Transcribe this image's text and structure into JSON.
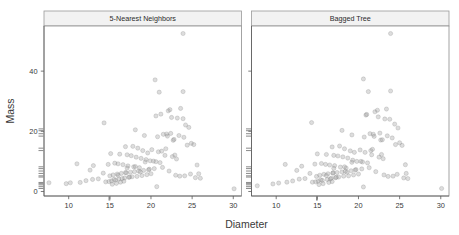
{
  "chart_data": {
    "type": "scatter",
    "title": "",
    "xlabel": "Diameter",
    "ylabel": "Mass",
    "xlim": [
      7.0,
      31.0
    ],
    "ylim": [
      -1.5,
      55.0
    ],
    "grid": false,
    "legend": null,
    "xticks": [
      10,
      15,
      20,
      25,
      30
    ],
    "xticklabels": [
      "10",
      "15",
      "20",
      "25",
      "30"
    ],
    "yticks": [
      0,
      20,
      40
    ],
    "yticklabels": [
      "0",
      "20",
      "40"
    ],
    "panels": [
      {
        "label": "5-Nearest Neighbors",
        "x": [
          23.9,
          20.5,
          21.0,
          23.9,
          20.6,
          22.1,
          22.3,
          23.6,
          23.9,
          24.2,
          14.3,
          21.2,
          22.5,
          23.2,
          24.6,
          21.9,
          22.4,
          23.4,
          24.0,
          24.9,
          18.1,
          19.2,
          20.8,
          21.5,
          22.0,
          22.8,
          24.4,
          25.2,
          25.6,
          19.6,
          16.9,
          17.8,
          18.4,
          19.0,
          20.1,
          20.9,
          21.7,
          22.6,
          23.1,
          25.8,
          15.1,
          16.2,
          17.1,
          17.6,
          18.2,
          18.8,
          19.4,
          20.3,
          21.1,
          23.0,
          13.0,
          14.8,
          15.6,
          16.0,
          16.6,
          17.2,
          17.9,
          18.6,
          19.8,
          24.8,
          11.0,
          12.6,
          14.2,
          15.0,
          15.4,
          15.9,
          16.4,
          17.0,
          17.5,
          18.0,
          18.5,
          19.1,
          19.7,
          20.4,
          21.4,
          22.2,
          23.5,
          25.4,
          26.0,
          30.1,
          7.6,
          9.7,
          10.2,
          11.4,
          12.1,
          12.9,
          13.6,
          14.5,
          15.2,
          15.7,
          16.1,
          16.5,
          16.8,
          17.3,
          17.7,
          18.3,
          18.9,
          19.5,
          20.0,
          20.7,
          15.3,
          15.8,
          16.3,
          16.7,
          17.4,
          18.7,
          19.3,
          21.3,
          22.9,
          24.1,
          14.9,
          15.5,
          16.0,
          16.9,
          17.1,
          18.1,
          19.9,
          20.6,
          21.8,
          22.7
        ],
        "y": [
          52.5,
          37.1,
          33.0,
          33.2,
          25.1,
          26.8,
          27.2,
          27.6,
          24.2,
          22.1,
          22.8,
          25.7,
          24.6,
          24.4,
          21.3,
          19.1,
          19.3,
          18.6,
          18.0,
          16.0,
          20.5,
          18.6,
          18.2,
          19.0,
          18.4,
          17.3,
          15.4,
          15.6,
          8.8,
          12.8,
          14.9,
          15.0,
          14.4,
          13.6,
          13.9,
          13.2,
          12.0,
          11.6,
          10.8,
          5.9,
          12.6,
          12.4,
          12.2,
          11.9,
          11.4,
          11.0,
          10.6,
          10.1,
          9.6,
          5.4,
          8.6,
          9.0,
          9.4,
          9.2,
          8.9,
          8.5,
          8.2,
          7.9,
          7.4,
          5.8,
          9.2,
          7.1,
          6.1,
          5.2,
          5.5,
          5.8,
          6.0,
          6.2,
          6.4,
          6.6,
          6.8,
          7.0,
          7.2,
          7.6,
          8.0,
          6.8,
          5.1,
          4.6,
          4.4,
          0.9,
          2.9,
          2.6,
          2.9,
          3.0,
          3.6,
          4.0,
          4.2,
          3.2,
          3.5,
          3.8,
          4.1,
          4.3,
          4.5,
          4.7,
          4.9,
          5.0,
          5.3,
          5.6,
          5.9,
          1.6,
          2.4,
          2.7,
          3.1,
          3.4,
          4.8,
          6.5,
          9.8,
          13.4,
          12.1,
          5.2,
          3.3,
          4.0,
          5.4,
          6.3,
          7.8,
          8.3,
          10.2,
          9.9,
          14.2,
          17.0
        ]
      },
      {
        "label": "Bagged Tree",
        "x": [
          23.9,
          20.6,
          21.2,
          23.9,
          20.9,
          22.0,
          22.3,
          23.4,
          23.8,
          24.4,
          14.3,
          21.0,
          22.4,
          23.2,
          24.8,
          21.8,
          22.6,
          23.5,
          24.1,
          25.0,
          18.0,
          19.2,
          20.7,
          21.4,
          21.9,
          22.7,
          24.5,
          25.3,
          25.7,
          19.5,
          16.8,
          17.7,
          18.3,
          19.0,
          20.2,
          20.8,
          21.6,
          22.5,
          23.0,
          25.8,
          15.0,
          16.1,
          17.0,
          17.5,
          18.1,
          18.7,
          19.3,
          20.3,
          21.1,
          23.1,
          13.1,
          14.7,
          15.5,
          16.0,
          16.5,
          17.1,
          17.8,
          18.5,
          19.7,
          24.7,
          11.1,
          12.5,
          14.1,
          14.9,
          15.3,
          15.8,
          16.3,
          16.9,
          17.4,
          18.0,
          18.4,
          19.1,
          19.6,
          20.4,
          21.3,
          22.1,
          23.6,
          25.5,
          26.0,
          30.1,
          7.7,
          9.6,
          10.3,
          11.3,
          12.0,
          12.8,
          13.5,
          14.4,
          15.1,
          15.6,
          16.2,
          16.6,
          16.7,
          17.2,
          17.6,
          18.2,
          18.8,
          19.4,
          20.0,
          20.6,
          15.2,
          15.7,
          16.4,
          16.8,
          17.3,
          18.6,
          19.2,
          21.5,
          22.8,
          24.2,
          14.8,
          15.4,
          16.1,
          16.9,
          17.0,
          18.3,
          19.8,
          20.5,
          21.7,
          22.9
        ],
        "y": [
          52.5,
          37.4,
          33.2,
          33.4,
          25.4,
          26.5,
          27.0,
          27.4,
          24.0,
          22.4,
          22.9,
          25.6,
          24.8,
          24.1,
          21.1,
          19.0,
          19.4,
          18.5,
          17.8,
          16.2,
          20.3,
          18.8,
          18.1,
          19.2,
          18.3,
          17.1,
          15.6,
          15.3,
          8.9,
          13.0,
          14.8,
          15.1,
          14.2,
          13.5,
          13.8,
          13.0,
          12.2,
          11.4,
          10.9,
          6.0,
          12.5,
          12.3,
          12.0,
          11.8,
          11.5,
          11.1,
          10.4,
          10.0,
          9.5,
          5.5,
          8.4,
          9.1,
          9.3,
          9.0,
          8.8,
          8.6,
          8.1,
          7.8,
          7.3,
          5.7,
          9.0,
          7.0,
          6.0,
          5.0,
          5.4,
          5.7,
          5.9,
          6.1,
          6.3,
          6.5,
          6.7,
          6.9,
          7.1,
          7.5,
          7.9,
          6.6,
          5.0,
          4.5,
          4.3,
          1.0,
          1.9,
          2.5,
          2.8,
          3.1,
          3.5,
          4.1,
          4.3,
          3.1,
          3.4,
          3.7,
          4.0,
          4.2,
          4.4,
          4.6,
          4.8,
          5.1,
          5.2,
          5.5,
          5.8,
          1.5,
          2.3,
          2.6,
          3.0,
          3.3,
          4.7,
          6.4,
          9.7,
          13.6,
          12.3,
          5.1,
          3.2,
          3.9,
          5.3,
          6.2,
          7.7,
          8.2,
          10.0,
          9.8,
          14.0,
          17.2
        ]
      }
    ],
    "y_rug": [
      1.0,
      1.6,
      2.2,
      2.6,
      3.0,
      4.8,
      5.2,
      6.0,
      6.8,
      7.6,
      8.2,
      13.6,
      14.4,
      18.4,
      19.2,
      20.2,
      20.8
    ],
    "x_rug": [
      14.9,
      15.0
    ],
    "colors": {
      "point_fill": "#9b9b9b",
      "point_stroke": "#6f6f6f",
      "strip_fill": "#f2f2f2",
      "strip_stroke": "#9a9a9a",
      "panel_border": "#8d8d8d",
      "axis": "#5a5a5a",
      "text": "#3a3a3a"
    }
  }
}
